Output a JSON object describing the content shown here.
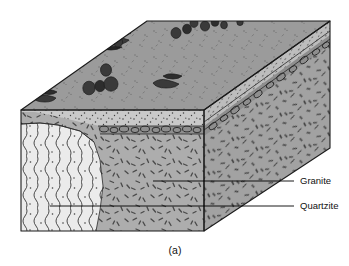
{
  "figure": {
    "caption": "(a)",
    "type": "geologic-block-diagram",
    "background": "#ffffff"
  },
  "labels": [
    {
      "id": "granite",
      "text": "Granite",
      "text_x": 300,
      "text_y": 181,
      "leader_x1": 153,
      "leader_y1": 181,
      "leader_x2": 294,
      "leader_y2": 181
    },
    {
      "id": "quartzite",
      "text": "Quartzite",
      "text_x": 300,
      "text_y": 206,
      "leader_x1": 50,
      "leader_y1": 206,
      "leader_x2": 294,
      "leader_y2": 206
    }
  ],
  "units": [
    {
      "id": "soil",
      "name": "stippled regolith",
      "color": "#c9c9c9"
    },
    {
      "id": "granite",
      "name": "Granite",
      "color": "#adadad"
    },
    {
      "id": "quartzite",
      "name": "Quartzite",
      "color": "#ebebeb"
    },
    {
      "id": "topsurface",
      "name": "ground surface",
      "color": "#9b9b9b"
    },
    {
      "id": "cobbles",
      "name": "cobble contact",
      "color": "#8a8a8a"
    }
  ],
  "geometry": {
    "front_top_left_x": 21,
    "front_top_left_y": 110,
    "front_top_right_x": 204,
    "front_top_right_y": 110,
    "front_bottom_left_x": 21,
    "front_bottom_left_y": 231,
    "front_bottom_right_x": 204,
    "front_bottom_right_y": 231,
    "back_top_left_x": 21,
    "back_top_left_y": 110,
    "apex_x": 330,
    "apex_y": 21,
    "right_bottom_x": 330,
    "right_bottom_y": 148
  },
  "colors": {
    "outline": "#1a1a1a",
    "label_text": "#111111",
    "boulder": "#3a3a3a",
    "boulder_dark": "#262626",
    "dash": "#4a4a4a",
    "stipple": "#3d3d3d"
  }
}
